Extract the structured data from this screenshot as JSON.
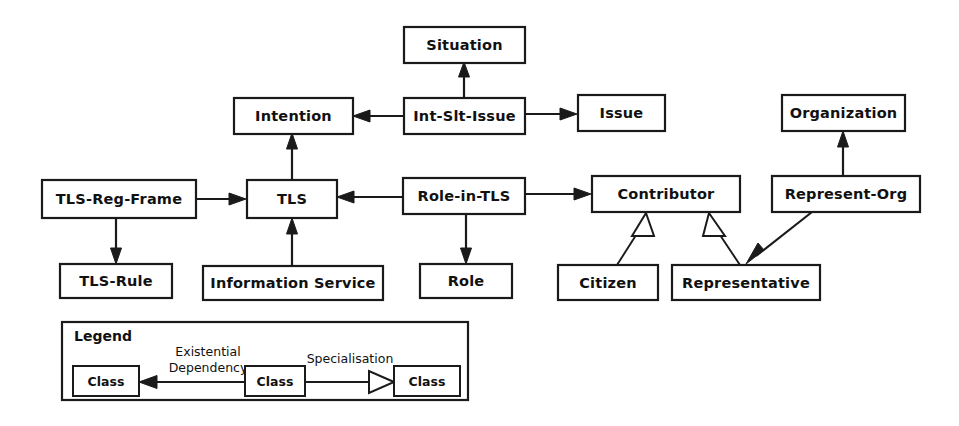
{
  "diagram": {
    "type": "uml-class-diagram",
    "background": "#ffffff",
    "stroke_color": "#1a1a1a",
    "nodes": [
      {
        "id": "situation",
        "label": "Situation",
        "x": 404,
        "y": 27,
        "w": 121,
        "h": 36
      },
      {
        "id": "intention",
        "label": "Intention",
        "x": 234,
        "y": 98,
        "w": 119,
        "h": 36
      },
      {
        "id": "int_slt",
        "label": "Int-Slt-Issue",
        "x": 404,
        "y": 98,
        "w": 121,
        "h": 36
      },
      {
        "id": "issue",
        "label": "Issue",
        "x": 578,
        "y": 95,
        "w": 87,
        "h": 36
      },
      {
        "id": "organization",
        "label": "Organization",
        "x": 782,
        "y": 95,
        "w": 123,
        "h": 36
      },
      {
        "id": "tls_reg",
        "label": "TLS-Reg-Frame",
        "x": 42,
        "y": 180,
        "w": 154,
        "h": 38
      },
      {
        "id": "tls",
        "label": "TLS",
        "x": 247,
        "y": 180,
        "w": 90,
        "h": 38
      },
      {
        "id": "role_in_tls",
        "label": "Role-in-TLS",
        "x": 403,
        "y": 178,
        "w": 122,
        "h": 36
      },
      {
        "id": "contributor",
        "label": "Contributor",
        "x": 592,
        "y": 176,
        "w": 148,
        "h": 36
      },
      {
        "id": "represent",
        "label": "Represent-Org",
        "x": 772,
        "y": 176,
        "w": 148,
        "h": 36
      },
      {
        "id": "tls_rule",
        "label": "TLS-Rule",
        "x": 60,
        "y": 264,
        "w": 112,
        "h": 34
      },
      {
        "id": "info_svc",
        "label": "Information Service",
        "x": 203,
        "y": 266,
        "w": 180,
        "h": 34
      },
      {
        "id": "role",
        "label": "Role",
        "x": 420,
        "y": 264,
        "w": 92,
        "h": 34
      },
      {
        "id": "citizen",
        "label": "Citizen",
        "x": 558,
        "y": 265,
        "w": 100,
        "h": 35
      },
      {
        "id": "representative",
        "label": "Representative",
        "x": 672,
        "y": 265,
        "w": 148,
        "h": 35
      }
    ],
    "edges": [
      {
        "from": "int_slt",
        "to": "situation",
        "kind": "existential-dependency"
      },
      {
        "from": "int_slt",
        "to": "intention",
        "kind": "existential-dependency"
      },
      {
        "from": "int_slt",
        "to": "issue",
        "kind": "existential-dependency"
      },
      {
        "from": "tls",
        "to": "intention",
        "kind": "existential-dependency"
      },
      {
        "from": "tls_reg",
        "to": "tls",
        "kind": "existential-dependency"
      },
      {
        "from": "role_in_tls",
        "to": "tls",
        "kind": "existential-dependency"
      },
      {
        "from": "info_svc",
        "to": "tls",
        "kind": "existential-dependency"
      },
      {
        "from": "tls_reg",
        "to": "tls_rule",
        "kind": "existential-dependency"
      },
      {
        "from": "role_in_tls",
        "to": "role",
        "kind": "existential-dependency"
      },
      {
        "from": "role_in_tls",
        "to": "contributor",
        "kind": "existential-dependency"
      },
      {
        "from": "represent",
        "to": "organization",
        "kind": "existential-dependency"
      },
      {
        "from": "represent",
        "to": "representative",
        "kind": "existential-dependency"
      },
      {
        "from": "citizen",
        "to": "contributor",
        "kind": "specialisation"
      },
      {
        "from": "representative",
        "to": "contributor",
        "kind": "specialisation"
      }
    ]
  },
  "legend": {
    "title": "Legend",
    "x": 62,
    "y": 322,
    "w": 406,
    "h": 78,
    "existential_label_line1": "Existential",
    "existential_label_line2": "Dependency",
    "specialisation_label": "Specialisation",
    "class_label_left": "Class",
    "class_label_middle": "Class",
    "class_label_right": "Class"
  }
}
